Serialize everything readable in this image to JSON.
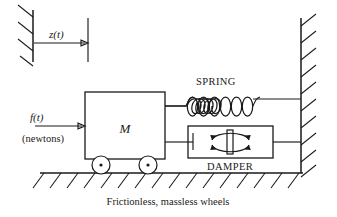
{
  "diagram": {
    "labels": {
      "displacement": "z(t)",
      "force": "f(t)",
      "force_units": "(newtons)",
      "mass": "M",
      "spring": "SPRING",
      "damper": "DAMPER",
      "caption": "Frictionless, massless wheels"
    },
    "colors": {
      "ink": "#1a1a1a",
      "background": "#ffffff"
    },
    "elements": {
      "reference_wall": "hatched vertical reference wall, upper left",
      "reference_mark": "vertical tick line at displaced position",
      "displacement_arrow": "horizontal arrow pointing right from wall to mark",
      "force_arrow": "horizontal arrow pointing right into mass block",
      "mass_block": "rectangle labeled M",
      "wheels": 2,
      "wheel_marker": "center dot",
      "spring_coils": 6,
      "damper_body": "rectangle with piston plate and two curved arrows",
      "damper_arrows": 2,
      "ground": "horizontal line with downward-right hatching",
      "right_wall": "vertical line with upward-right hatching"
    }
  }
}
